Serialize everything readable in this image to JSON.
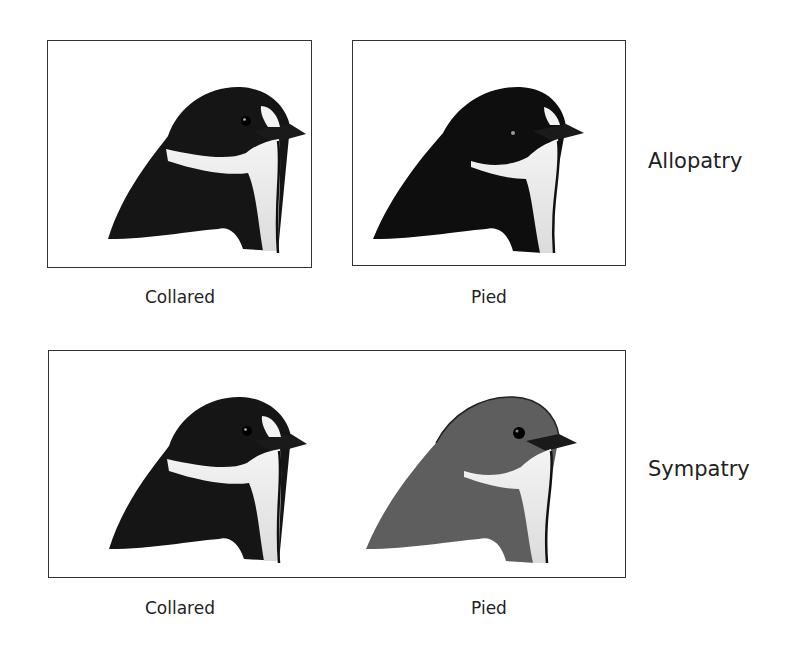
{
  "figure": {
    "rows": [
      {
        "label": "Allopatry",
        "panels": [
          {
            "caption": "Collared",
            "species": "Collared flycatcher",
            "plumage": "black-and-white",
            "collar": "full white collar",
            "forehead_patch": "large white patch",
            "body_color": "#151515"
          },
          {
            "caption": "Pied",
            "species": "Pied flycatcher",
            "plumage": "black-and-white",
            "collar": "partial white throat",
            "forehead_patch": "small white patch",
            "body_color": "#0e0e0e"
          }
        ]
      },
      {
        "label": "Sympatry",
        "panels": [
          {
            "caption": "Collared",
            "species": "Collared flycatcher",
            "plumage": "black-and-white",
            "collar": "full white collar",
            "forehead_patch": "large white patch",
            "body_color": "#151515"
          },
          {
            "caption": "Pied",
            "species": "Pied flycatcher",
            "plumage": "dull brown-grey",
            "collar": "partial white throat",
            "forehead_patch": "none",
            "body_color": "#5e5e5e"
          }
        ]
      }
    ]
  }
}
